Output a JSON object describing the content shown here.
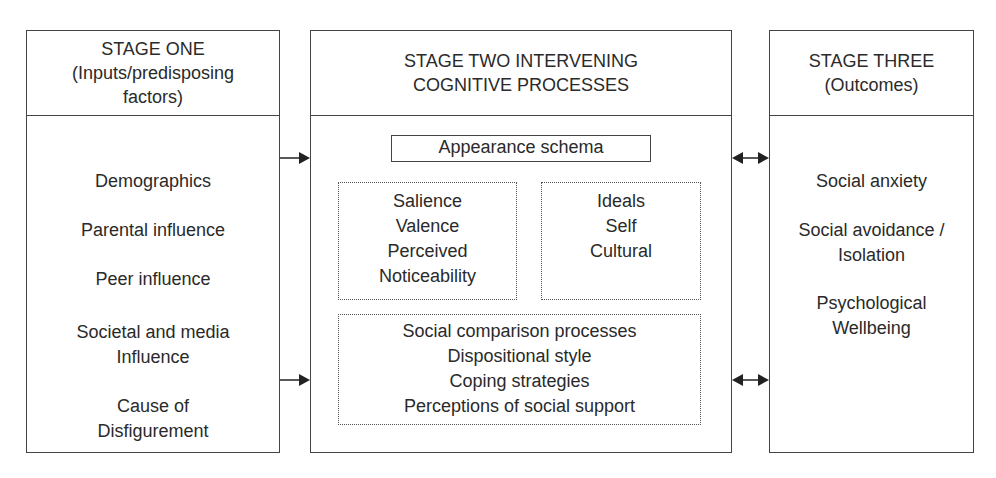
{
  "stage_one": {
    "title_lines": [
      "STAGE ONE",
      "(Inputs/predisposing",
      "factors)"
    ],
    "items": [
      {
        "lines": [
          "Demographics"
        ]
      },
      {
        "lines": [
          "Parental influence"
        ]
      },
      {
        "lines": [
          "Peer influence"
        ]
      },
      {
        "lines": [
          "Societal and media",
          "Influence"
        ]
      },
      {
        "lines": [
          "Cause of",
          "Disfigurement"
        ]
      }
    ]
  },
  "stage_two": {
    "title_lines": [
      "STAGE TWO INTERVENING",
      "COGNITIVE PROCESSES"
    ],
    "appearance_schema": "Appearance schema",
    "schema_left_lines": [
      "Salience",
      "Valence",
      "Perceived",
      "Noticeability"
    ],
    "schema_right_lines": [
      "Ideals",
      "Self",
      "Cultural"
    ],
    "processes_lines": [
      "Social comparison processes",
      "Dispositional style",
      "Coping strategies",
      "Perceptions of social support"
    ]
  },
  "stage_three": {
    "title_lines": [
      "STAGE THREE",
      "(Outcomes)"
    ],
    "items": [
      {
        "lines": [
          "Social anxiety"
        ]
      },
      {
        "lines": [
          "Social avoidance /",
          "Isolation"
        ]
      },
      {
        "lines": [
          "Psychological",
          "Wellbeing"
        ]
      }
    ]
  },
  "connectors": [
    {
      "from": "stage_one",
      "to": "stage_two",
      "type": "single-arrow",
      "count": 2
    },
    {
      "from": "stage_two",
      "to": "stage_three",
      "type": "double-arrow",
      "count": 2
    }
  ]
}
